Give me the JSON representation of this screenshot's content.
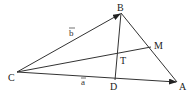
{
  "diagram": {
    "points": {
      "A": {
        "label": "A",
        "x": 177,
        "y": 82
      },
      "B": {
        "label": "B",
        "x": 121,
        "y": 13
      },
      "C": {
        "label": "C",
        "x": 17,
        "y": 72
      },
      "D": {
        "label": "D",
        "x": 115,
        "y": 80
      },
      "M": {
        "label": "M",
        "x": 151,
        "y": 47
      },
      "T": {
        "label": "T",
        "x": 118,
        "y": 55
      }
    },
    "vectors": {
      "a": {
        "label": "a",
        "from": "C",
        "to": "A"
      },
      "b": {
        "label": "b",
        "from": "C",
        "to": "B"
      }
    },
    "segments": [
      "CA",
      "CB",
      "BA",
      "CM",
      "BD"
    ],
    "line_color": "#333333"
  }
}
